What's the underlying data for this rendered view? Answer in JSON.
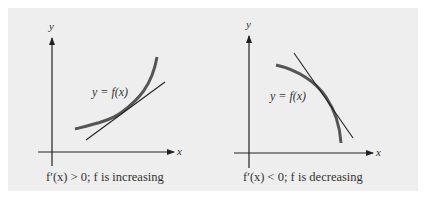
{
  "colors": {
    "background": "#ffffff",
    "panel": "#eeeeee",
    "axis": "#222222",
    "curve": "#555555",
    "tangent": "#222222",
    "text": "#333333"
  },
  "figures": [
    {
      "id": "increasing",
      "y_axis_label": "y",
      "x_axis_label": "x",
      "curve_label": "y = f(x)",
      "caption": "f′(x) > 0; f is increasing",
      "curve_shape": "concave-up increasing",
      "tangent": "line touching curve with positive slope"
    },
    {
      "id": "decreasing",
      "y_axis_label": "y",
      "x_axis_label": "x",
      "curve_label": "y = f(x)",
      "caption": "f′(x) < 0; f is decreasing",
      "curve_shape": "concave-down decreasing",
      "tangent": "line touching curve with negative slope"
    }
  ]
}
